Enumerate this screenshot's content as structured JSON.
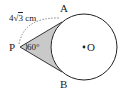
{
  "diagram": {
    "labels": {
      "A": "A",
      "B": "B",
      "P": "P",
      "O": "O",
      "angle": "60°",
      "length_prefix": "4",
      "length_radicand": "3",
      "length_unit": " cm"
    },
    "colors": {
      "shade": "#c9c9c9",
      "stroke": "#222222"
    },
    "geometry": {
      "circle_center": [
        84,
        47
      ],
      "circle_radius": 33,
      "P": [
        20,
        47
      ],
      "A": [
        62,
        22
      ],
      "B": [
        62,
        72
      ]
    }
  }
}
